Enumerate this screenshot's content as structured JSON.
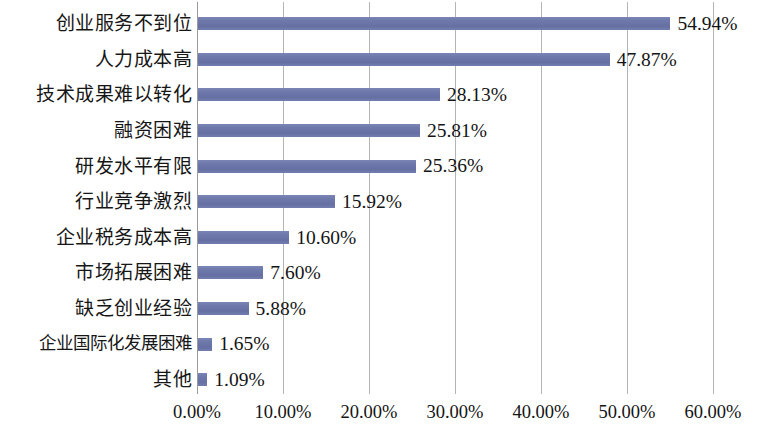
{
  "chart_data": {
    "type": "bar",
    "orientation": "horizontal",
    "title": "",
    "subtitle": "",
    "xlabel": "",
    "ylabel": "",
    "xlim": [
      0,
      60
    ],
    "grid": true,
    "legend": false,
    "legend_position": "none",
    "bar_color": "#6e79ab",
    "gridline_color": "#b5b5b5",
    "axis_tick_labels": [
      "0.00%",
      "10.00%",
      "20.00%",
      "30.00%",
      "40.00%",
      "50.00%",
      "60.00%"
    ],
    "axis_tick_values": [
      0,
      10,
      20,
      30,
      40,
      50,
      60
    ],
    "categories": [
      "创业服务不到位",
      "人力成本高",
      "技术成果难以转化",
      "融资困难",
      "研发水平有限",
      "行业竞争激烈",
      "企业税务成本高",
      "市场拓展困难",
      "缺乏创业经验",
      "企业国际化发展困难",
      "其他"
    ],
    "values": [
      54.94,
      47.87,
      28.13,
      25.81,
      25.36,
      15.92,
      10.6,
      7.6,
      5.88,
      1.65,
      1.09
    ],
    "value_labels": [
      "54.94%",
      "47.87%",
      "28.13%",
      "25.81%",
      "25.36%",
      "15.92%",
      "10.60%",
      "7.60%",
      "5.88%",
      "1.65%",
      "1.09%"
    ],
    "rows": [
      {
        "category": "创业服务不到位",
        "value": 54.94,
        "label": "54.94%"
      },
      {
        "category": "人力成本高",
        "value": 47.87,
        "label": "47.87%"
      },
      {
        "category": "技术成果难以转化",
        "value": 28.13,
        "label": "28.13%"
      },
      {
        "category": "融资困难",
        "value": 25.81,
        "label": "25.81%"
      },
      {
        "category": "研发水平有限",
        "value": 25.36,
        "label": "25.36%"
      },
      {
        "category": "行业竞争激烈",
        "value": 15.92,
        "label": "15.92%"
      },
      {
        "category": "企业税务成本高",
        "value": 10.6,
        "label": "10.60%"
      },
      {
        "category": "市场拓展困难",
        "value": 7.6,
        "label": "7.60%"
      },
      {
        "category": "缺乏创业经验",
        "value": 5.88,
        "label": "5.88%"
      },
      {
        "category": "企业国际化发展困难",
        "value": 1.65,
        "label": "1.65%"
      },
      {
        "category": "其他",
        "value": 1.09,
        "label": "1.09%"
      }
    ]
  }
}
